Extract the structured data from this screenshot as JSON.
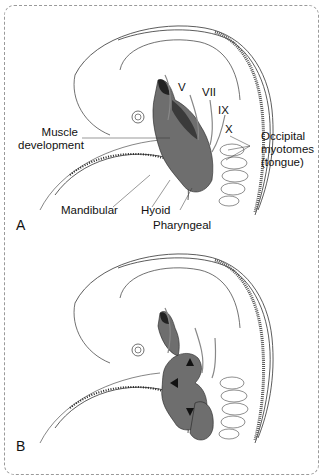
{
  "figure": {
    "panels": [
      {
        "id": "A",
        "letter": "A",
        "labels": {
          "nerve_v": "V",
          "nerve_vii": "VII",
          "nerve_ix": "IX",
          "nerve_x": "X",
          "muscle_line1": "Muscle",
          "muscle_line2": "development",
          "occipital_line1": "Occipital",
          "occipital_line2": "myotomes",
          "occipital_line3": "(tongue)",
          "mandibular": "Mandibular",
          "hyoid": "Hyoid",
          "pharyngeal": "Pharyngeal"
        }
      },
      {
        "id": "B",
        "letter": "B",
        "labels": {}
      }
    ],
    "colors": {
      "outline": "#333333",
      "muscle_fill": "#6e6e6e",
      "muscle_dark": "#2a2a2a",
      "frame": "#9a9a9a"
    }
  }
}
